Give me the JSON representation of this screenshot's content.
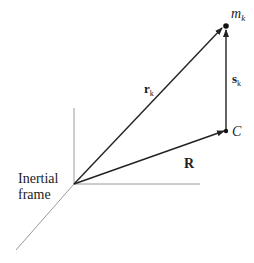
{
  "diagram": {
    "frame_label_line1": "Inertial",
    "frame_label_line2": "frame",
    "labels": {
      "r_main": "r",
      "r_sub": "k",
      "s_main": "s",
      "s_sub": "k",
      "m_main": "m",
      "m_sub": "k",
      "R": "R",
      "C": "C"
    },
    "colors": {
      "axis": "#999999",
      "vector": "#222222",
      "text": "#222222"
    }
  }
}
